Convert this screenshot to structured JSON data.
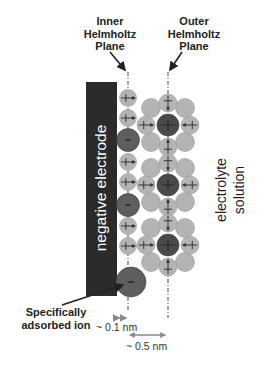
{
  "diagram": {
    "type": "electric double layer schematic",
    "labels": {
      "inner_helmholtz_plane": [
        "Inner",
        "Helmholtz",
        "Plane"
      ],
      "outer_helmholtz_plane": [
        "Outer",
        "Helmholtz",
        "Plane"
      ],
      "electrode": "negative electrode",
      "electrolyte": [
        "electrolyte",
        "solution"
      ],
      "specifically_adsorbed_ion": [
        "Specifically",
        "adsorbed ion"
      ],
      "ihp_distance": "~ 0.1 nm",
      "ohp_distance": "~ 0.5 nm"
    },
    "symbols": {
      "cation_sign": "+",
      "anion_sign": "-"
    },
    "colors": {
      "electrode": "#2b2b2b",
      "electrode_text": "#ffffff",
      "water": "#b4b4b4",
      "water_stroke": "#9a9a9a",
      "cation": "#4a4a4a",
      "anion": "#5e5e5e",
      "arrow": "#8a8a8a",
      "text": "#222222"
    },
    "ihp_column": {
      "x": 128,
      "items": [
        {
          "kind": "water",
          "y": 98
        },
        {
          "kind": "water",
          "y": 118
        },
        {
          "kind": "anion",
          "y": 140
        },
        {
          "kind": "water",
          "y": 162
        },
        {
          "kind": "water",
          "y": 182
        },
        {
          "kind": "anion",
          "y": 205
        },
        {
          "kind": "water",
          "y": 226
        },
        {
          "kind": "water",
          "y": 246
        }
      ],
      "adsorbed_ion_y": 282
    },
    "solvated_cations": [
      {
        "x": 168,
        "y": 125
      },
      {
        "x": 168,
        "y": 185
      },
      {
        "x": 168,
        "y": 245
      }
    ]
  }
}
